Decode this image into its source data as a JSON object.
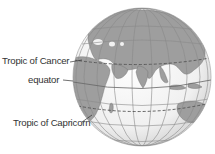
{
  "diagram": {
    "colors": {
      "ocean": "#f4f4f4",
      "land": "#9e9e9e",
      "grid": "#8a8a8a",
      "tropic_line": "#555555",
      "text": "#333333"
    },
    "labels": [
      {
        "id": "tropic-of-cancer",
        "text": "Tropic of Cancer"
      },
      {
        "id": "equator",
        "text": "equator"
      },
      {
        "id": "tropic-of-capricorn",
        "text": "Tropic of Capricorn"
      }
    ]
  }
}
